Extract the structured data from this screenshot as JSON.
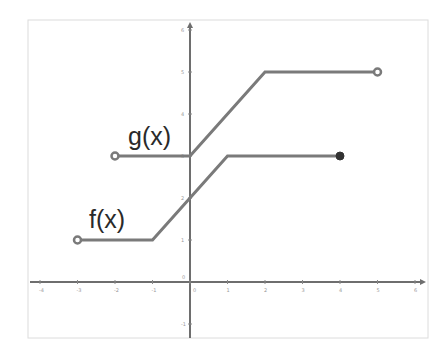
{
  "chart_data": {
    "type": "line",
    "title": "",
    "xlabel": "",
    "ylabel": "",
    "xlim": [
      -4.3,
      6.2
    ],
    "ylim": [
      -1.7,
      6.3
    ],
    "grid": false,
    "x_ticks": [
      "-4",
      "-3",
      "-2",
      "-1",
      "0",
      "1",
      "2",
      "3",
      "4",
      "5",
      "6"
    ],
    "y_ticks": [
      "-1",
      "0",
      "1",
      "2",
      "3",
      "4",
      "5",
      "6"
    ],
    "series": [
      {
        "name": "f(x)",
        "points": [
          [
            -3,
            1
          ],
          [
            -1,
            1
          ],
          [
            1,
            3
          ],
          [
            4,
            3
          ]
        ],
        "start_marker": "open",
        "end_marker": "closed"
      },
      {
        "name": "g(x)",
        "points": [
          [
            -2,
            3
          ],
          [
            0,
            3
          ],
          [
            2,
            5
          ],
          [
            5,
            5
          ]
        ],
        "start_marker": "open",
        "end_marker": "open"
      }
    ],
    "annotations": [
      {
        "text": "f(x)",
        "x": -2.2,
        "y": 1.4
      },
      {
        "text": "g(x)",
        "x": -0.75,
        "y": 3.4
      }
    ]
  },
  "labels": {
    "f": "f(x)",
    "g": "g(x)"
  },
  "colors": {
    "line": "#7a7a7a",
    "axis": "#666666",
    "frame": "#dddddd",
    "closed_dot": "#333333",
    "open_dot_fill": "#ffffff"
  }
}
